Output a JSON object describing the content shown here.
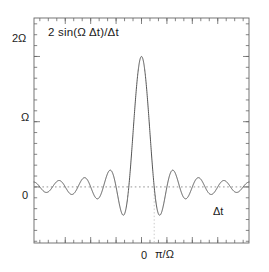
{
  "figure": {
    "width": 269,
    "height": 272,
    "background_color": "#ffffff",
    "curve_color": "#555555",
    "axis_color": "#666666",
    "guide_color": "#8a8a8a",
    "text_color": "#1a1a1a"
  },
  "annotation": {
    "formula": "2 sin(Ω Δt)/Δt"
  },
  "axes": {
    "x_axis_label": "Δt",
    "x_tick_labels": [
      "0",
      "π/Ω"
    ],
    "y_tick_labels": [
      "0",
      "Ω",
      "2Ω"
    ]
  },
  "chart_data": {
    "type": "line",
    "title": "",
    "subtitle": "",
    "xlabel": "Δt",
    "ylabel": "",
    "annotations": [
      "2 sin(Ω Δt)/Δt"
    ],
    "legend": [],
    "legend_position": "none",
    "grid": false,
    "guides": [
      {
        "kind": "horizontal",
        "value": 0,
        "style": "dotted",
        "label": "0"
      },
      {
        "kind": "vertical",
        "value": 1.0,
        "style": "dotted",
        "label": "π/Ω"
      }
    ],
    "x_unit": "π/Ω",
    "xlim": [
      -8.46,
      8.46
    ],
    "ylim": [
      -0.86,
      2.59
    ],
    "y_unit": "Ω",
    "x_ticks_major": [
      -6,
      -4,
      -2,
      0,
      2,
      4,
      6
    ],
    "x_ticks_minor_step": 0.6667,
    "y_ticks_major": [
      0,
      1,
      2
    ],
    "y_ticks_minor_step": 0.1667,
    "x_tick_label_values": [
      0,
      1
    ],
    "x_tick_label_text": [
      "0",
      "π/Ω"
    ],
    "y_tick_label_values": [
      0,
      1,
      2
    ],
    "y_tick_label_text": [
      "0",
      "Ω",
      "2Ω"
    ],
    "function": "y = 2*sin(pi*x)/(pi*x)  [in units where x = ΩΔt/π, y in units of Ω]",
    "peak_value": 2,
    "peak_x": 0,
    "zeros_x": [
      -8,
      -7,
      -6,
      -5,
      -4,
      -3,
      -2,
      -1,
      1,
      2,
      3,
      4,
      5,
      6,
      7,
      8
    ],
    "x": [
      -8.4,
      -8.0,
      -7.5,
      -7.0,
      -6.5,
      -6.0,
      -5.5,
      -5.0,
      -4.5,
      -4.0,
      -3.5,
      -3.0,
      -2.5,
      -2.0,
      -1.5,
      -1.0,
      -0.5,
      -0.25,
      0.0,
      0.25,
      0.5,
      1.0,
      1.5,
      2.0,
      2.5,
      3.0,
      3.5,
      4.0,
      4.5,
      5.0,
      5.5,
      6.0,
      6.5,
      7.0,
      7.5,
      8.0,
      8.4
    ],
    "values": [
      -0.15,
      0.0,
      0.085,
      0.0,
      -0.098,
      0.0,
      0.116,
      0.0,
      -0.141,
      0.0,
      0.182,
      0.0,
      -0.255,
      0.0,
      0.424,
      0.0,
      1.273,
      1.8,
      2.0,
      1.8,
      1.273,
      0.0,
      -0.424,
      0.0,
      0.255,
      0.0,
      -0.182,
      0.0,
      0.141,
      0.0,
      -0.116,
      0.0,
      0.098,
      0.0,
      -0.085,
      0.0,
      0.15
    ]
  }
}
